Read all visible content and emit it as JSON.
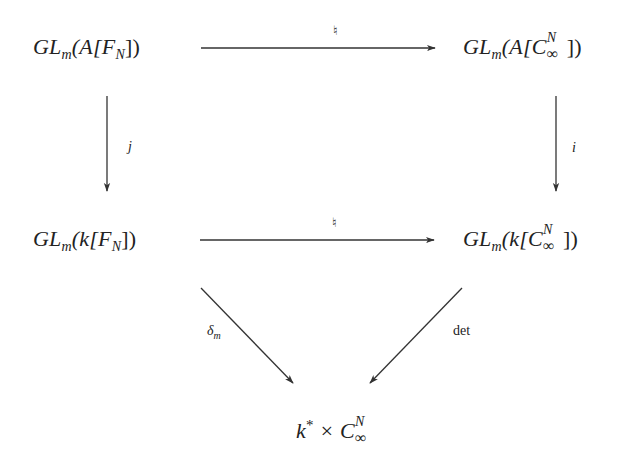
{
  "diagram": {
    "type": "commutative-diagram",
    "nodes": {
      "top_left": {
        "prefix": "GL",
        "sub": "m",
        "open": "(A[F",
        "sub2": "N",
        "close": "])"
      },
      "top_right": {
        "prefix": "GL",
        "sub": "m",
        "open": "(A[C",
        "sup": "N",
        "subsym": "∞",
        "close": "])"
      },
      "mid_left": {
        "prefix": "GL",
        "sub": "m",
        "open": "(k[F",
        "sub2": "N",
        "close": "])"
      },
      "mid_right": {
        "prefix": "GL",
        "sub": "m",
        "open": "(k[C",
        "sup": "N",
        "subsym": "∞",
        "close": "])"
      },
      "bottom": {
        "base": "k",
        "star": "*",
        "times": " × C",
        "sup": "N",
        "subsym": "∞"
      }
    },
    "arrows": [
      {
        "from": "top_left",
        "to": "top_right",
        "label": "♮"
      },
      {
        "from": "top_left",
        "to": "mid_left",
        "label": "j"
      },
      {
        "from": "top_right",
        "to": "mid_right",
        "label": "i"
      },
      {
        "from": "mid_left",
        "to": "mid_right",
        "label": "♮"
      },
      {
        "from": "mid_left",
        "to": "bottom",
        "label": "δ",
        "label_sub": "m"
      },
      {
        "from": "mid_right",
        "to": "bottom",
        "label": "det"
      }
    ],
    "stroke_color": "#333333",
    "text_color": "#222222"
  }
}
